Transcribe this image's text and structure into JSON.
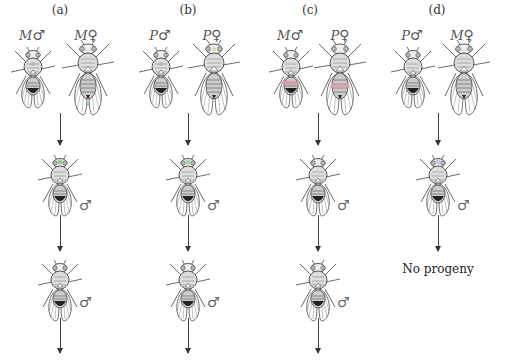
{
  "figure": {
    "columns": [
      {
        "label": "(a)",
        "parents": [
          {
            "strain": "M",
            "sex": "♂"
          },
          {
            "strain": "M",
            "sex": "♀"
          }
        ],
        "offspring": [
          {
            "sex": "♂"
          },
          {
            "sex": "♂"
          }
        ],
        "continues": true,
        "result_text": ""
      },
      {
        "label": "(b)",
        "parents": [
          {
            "strain": "P",
            "sex": "♂"
          },
          {
            "strain": "P",
            "sex": "♀"
          }
        ],
        "offspring": [
          {
            "sex": "♂"
          },
          {
            "sex": "♂"
          }
        ],
        "continues": true,
        "result_text": ""
      },
      {
        "label": "(c)",
        "parents": [
          {
            "strain": "M",
            "sex": "♂"
          },
          {
            "strain": "P",
            "sex": "♀"
          }
        ],
        "offspring": [
          {
            "sex": "♂"
          },
          {
            "sex": "♂"
          }
        ],
        "continues": true,
        "result_text": ""
      },
      {
        "label": "(d)",
        "parents": [
          {
            "strain": "P",
            "sex": "♂"
          },
          {
            "strain": "M",
            "sex": "♀"
          }
        ],
        "offspring": [
          {
            "sex": "♂"
          }
        ],
        "continues": false,
        "result_text": "No progeny"
      }
    ]
  },
  "colors": {
    "line": "#333333",
    "accent_pink": "#d9a0a8",
    "accent_green": "#7fbf8a"
  }
}
